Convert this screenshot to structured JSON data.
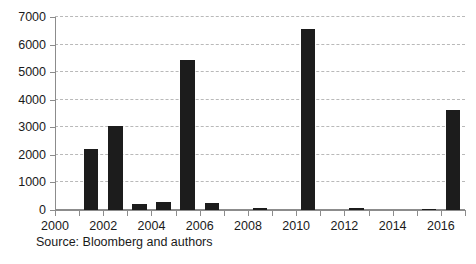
{
  "chart_data": {
    "type": "bar",
    "title": "",
    "subtitle": "",
    "xlabel": "",
    "ylabel": "",
    "categories": [
      2000,
      2001,
      2002,
      2003,
      2004,
      2005,
      2006,
      2007,
      2008,
      2009,
      2010,
      2011,
      2012,
      2013,
      2014,
      2015,
      2016
    ],
    "values": [
      0,
      2210,
      3050,
      220,
      290,
      5450,
      250,
      0,
      60,
      0,
      6560,
      0,
      55,
      0,
      0,
      20,
      3620
    ],
    "xlim": [
      2000,
      2017
    ],
    "ylim": [
      0,
      7000
    ],
    "ytick_labels": [
      "0",
      "1000",
      "2000",
      "3000",
      "4000",
      "5000",
      "6000",
      "7000"
    ],
    "ytick_values": [
      0,
      1000,
      2000,
      3000,
      4000,
      5000,
      6000,
      7000
    ],
    "xtick_values": [
      2000,
      2001,
      2002,
      2003,
      2004,
      2005,
      2006,
      2007,
      2008,
      2009,
      2010,
      2011,
      2012,
      2013,
      2014,
      2015,
      2016,
      2017
    ],
    "xtick_labels": [
      {
        "value": 2000,
        "label": "2000"
      },
      {
        "value": 2002,
        "label": "2002"
      },
      {
        "value": 2004,
        "label": "2004"
      },
      {
        "value": 2006,
        "label": "2006"
      },
      {
        "value": 2008,
        "label": "2008"
      },
      {
        "value": 2010,
        "label": "2010"
      },
      {
        "value": 2012,
        "label": "2012"
      },
      {
        "value": 2014,
        "label": "2014"
      },
      {
        "value": 2016,
        "label": "2016"
      }
    ],
    "grid": {
      "horizontal": true,
      "vertical": false,
      "style": "dashed"
    },
    "legend": {
      "visible": false,
      "position": "none"
    },
    "bar_color": "#1c1c1c",
    "grid_color": "#b9b9b9",
    "axis_color": "#8c8c8c",
    "background": "#ffffff"
  },
  "caption": {
    "source_text": "Source: Bloomberg and authors"
  }
}
